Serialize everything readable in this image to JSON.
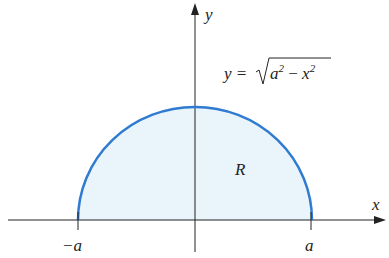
{
  "diagram": {
    "type": "region under semicircle",
    "axes": {
      "x_label": "x",
      "y_label": "y"
    },
    "curve_equation_lhs": "y =",
    "curve_equation_radicand_a": "a",
    "curve_equation_radicand_minus": " − ",
    "curve_equation_radicand_x": "x",
    "curve_equation_exponent": "2",
    "region_label": "R",
    "tick_left": "−a",
    "tick_right": "a",
    "colors": {
      "curve": "#2f7bd1",
      "fill": "#eaf4fb",
      "axis": "#222222"
    }
  }
}
